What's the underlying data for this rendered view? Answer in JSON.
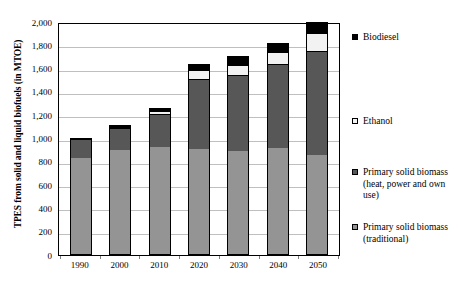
{
  "chart_data": {
    "type": "bar",
    "subtype": "stacked-bar",
    "title": "",
    "xlabel": "",
    "ylabel": "TPES from solid and liquid biofuels (in MTOE)",
    "categories": [
      "1990",
      "2000",
      "2010",
      "2020",
      "2030",
      "2040",
      "2050"
    ],
    "ylim": [
      0,
      2000
    ],
    "yticks": [
      0,
      200,
      400,
      600,
      800,
      1000,
      1200,
      1400,
      1600,
      1800,
      2000
    ],
    "ytick_labels": [
      "0",
      "200",
      "400",
      "600",
      "800",
      "1,000",
      "1,200",
      "1,400",
      "1,600",
      "1,800",
      "2,000"
    ],
    "grid": true,
    "legend_position": "right",
    "series": [
      {
        "name": "Primary solid biomass (traditional)",
        "color": "#949494",
        "values": [
          820,
          890,
          915,
          905,
          885,
          910,
          850
        ]
      },
      {
        "name": "Primary solid biomass (heat, power and own use)",
        "color": "#575757",
        "values": [
          165,
          195,
          285,
          600,
          650,
          720,
          895
        ]
      },
      {
        "name": "Ethanol",
        "color": "#f2f2f2",
        "values": [
          0,
          5,
          30,
          75,
          90,
          105,
          155
        ]
      },
      {
        "name": "Biodiesel",
        "color": "#000000",
        "values": [
          0,
          5,
          15,
          45,
          70,
          65,
          85
        ]
      }
    ],
    "totals": [
      985,
      1095,
      1245,
      1625,
      1695,
      1800,
      1985
    ]
  },
  "legend": {
    "items": [
      {
        "label": "Biodiesel",
        "swatch": "sw-bio"
      },
      {
        "label": "Ethanol",
        "swatch": "sw-eth"
      },
      {
        "label": "Primary solid biomass (heat, power and own use)",
        "swatch": "sw-heat"
      },
      {
        "label": "Primary solid biomass (traditional)",
        "swatch": "sw-trad"
      }
    ]
  }
}
